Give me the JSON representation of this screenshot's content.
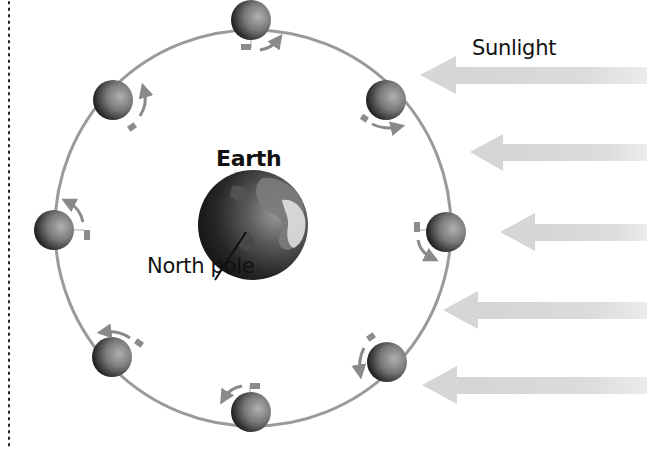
{
  "labels": {
    "sunlight": "Sunlight",
    "earth": "Earth",
    "north_pole": "North pole"
  },
  "colors": {
    "orbit": "#9a9a9a",
    "arrow_sunlight": "#d8d8d8",
    "rotation_arrow": "#8a8a8a",
    "flag": "#8c8c8c",
    "dotted_border": "#222222",
    "moon_dark": "#1a1a1a",
    "moon_light": "#9c9c9c",
    "earth_dark": "#1c1c1c",
    "earth_land": "#8a8a8a",
    "earth_bright": "#e2e2e2"
  },
  "diagram": {
    "orbit": {
      "cx": 253,
      "cy": 228,
      "r": 198
    },
    "earth": {
      "cx": 253,
      "cy": 225,
      "r": 55
    },
    "moons": [
      {
        "position": "top",
        "cx": 251,
        "cy": 20
      },
      {
        "position": "top-right",
        "cx": 386,
        "cy": 100
      },
      {
        "position": "right",
        "cx": 446,
        "cy": 232
      },
      {
        "position": "bottom-right",
        "cx": 387,
        "cy": 362
      },
      {
        "position": "bottom",
        "cx": 251,
        "cy": 412
      },
      {
        "position": "bottom-left",
        "cx": 112,
        "cy": 357
      },
      {
        "position": "left",
        "cx": 54,
        "cy": 230
      },
      {
        "position": "top-left",
        "cx": 113,
        "cy": 100
      }
    ],
    "sunlight_arrows_y": [
      75,
      152,
      232,
      310,
      385
    ]
  }
}
